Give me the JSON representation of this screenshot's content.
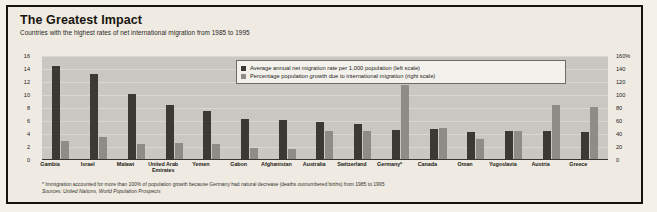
{
  "header": {
    "title": "The Greatest Impact",
    "subtitle": "Countries with the highest rates of net international migration from 1985 to 1995"
  },
  "legend": {
    "series1": "Average annual net migration rate per 1,000 population (left scale)",
    "series2": "Percentage population growth due to international migration (right scale)"
  },
  "footnotes": {
    "line1": "* Immigration accounted for more than 100% of population growth because Germany had natural decrease (deaths outnumbered births) from 1985 to 1995",
    "line2": "Sources: United Nations, World Population Prospects"
  },
  "chart_data": {
    "type": "bar",
    "title": "The Greatest Impact",
    "subtitle": "Countries with the highest rates of net international migration from 1985 to 1995",
    "xlabel": "",
    "ylabel": "",
    "grid": true,
    "legend_position": "top-right",
    "categories": [
      "Gambia",
      "Israel",
      "Malawi",
      "United Arab Emirates",
      "Yemen",
      "Gabon",
      "Afghanistan",
      "Australia",
      "Switzerland",
      "Germany*",
      "Canada",
      "Oman",
      "Yugoslavia",
      "Austria",
      "Greece"
    ],
    "series": [
      {
        "name": "Average annual net migration rate per 1,000 population (left scale)",
        "axis": "left",
        "ylim": [
          0,
          16
        ],
        "yticks": [
          0,
          2,
          4,
          6,
          8,
          10,
          12,
          14,
          16
        ],
        "values": [
          14.5,
          13.3,
          10.2,
          8.5,
          7.5,
          6.3,
          6.2,
          5.9,
          5.5,
          4.6,
          4.8,
          4.3,
          4.5,
          4.5,
          4.3
        ]
      },
      {
        "name": "Percentage population growth due to international migration (right scale)",
        "axis": "right",
        "ylim": [
          0,
          160
        ],
        "yticks": [
          "0",
          "20",
          "40",
          "60",
          "80",
          "100",
          "120",
          "140",
          "160%"
        ],
        "values": [
          30,
          36,
          24,
          26,
          24,
          18,
          17,
          45,
          44,
          115,
          50,
          33,
          44,
          85,
          82
        ]
      }
    ],
    "axis_left_ticks": [
      "16",
      "14",
      "12",
      "10",
      "8",
      "6",
      "4",
      "2",
      "0"
    ],
    "axis_right_ticks": [
      "160%",
      "140",
      "120",
      "100",
      "80",
      "60",
      "40",
      "20",
      "0"
    ]
  }
}
